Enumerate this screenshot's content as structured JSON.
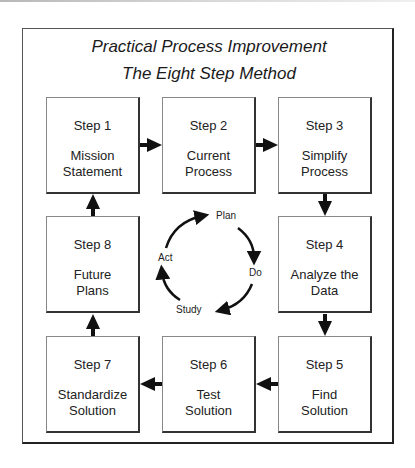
{
  "title": {
    "line1": "Practical Process Improvement",
    "line2": "The Eight Step Method"
  },
  "steps": [
    {
      "num": "Step 1",
      "line1": "Mission",
      "line2": "Statement"
    },
    {
      "num": "Step 2",
      "line1": "Current",
      "line2": "Process"
    },
    {
      "num": "Step 3",
      "line1": "Simplify",
      "line2": "Process"
    },
    {
      "num": "Step 4",
      "line1": "Analyze the",
      "line2": "Data"
    },
    {
      "num": "Step 5",
      "line1": "Find",
      "line2": "Solution"
    },
    {
      "num": "Step 6",
      "line1": "Test",
      "line2": "Solution"
    },
    {
      "num": "Step 7",
      "line1": "Standardize",
      "line2": "Solution"
    },
    {
      "num": "Step 8",
      "line1": "Future",
      "line2": "Plans"
    }
  ],
  "cycle": {
    "plan": "Plan",
    "do": "Do",
    "study": "Study",
    "act": "Act"
  },
  "colors": {
    "line": "#222222",
    "text": "#1a1a1a",
    "background": "#ffffff"
  }
}
